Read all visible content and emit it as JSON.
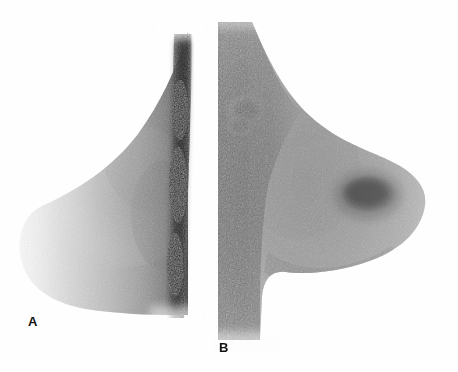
{
  "figure": {
    "kind": "scintimammography-image-pair",
    "background_color": "#fefefe",
    "width": 458,
    "height": 372,
    "panels": [
      {
        "label": "A",
        "label_x": 28,
        "label_y": 315,
        "description": "lateral breast scintigram with diffuse homogeneous uptake and no focal lesion",
        "view": "lateral",
        "chest_wall_side": "right",
        "focal_lesion": "none",
        "peak_intensity_color": "#111111",
        "parenchyma_color": "#9a9a9a"
      },
      {
        "label": "B",
        "label_x": 219,
        "label_y": 341,
        "description": "lateral breast scintigram showing intense focal uptake in the breast and increased axillary activity",
        "view": "lateral",
        "chest_wall_side": "left",
        "focal_lesion": "present",
        "focal_lesion_center_x": 368,
        "focal_lesion_center_y": 194,
        "focal_lesion_radius_x": 26,
        "focal_lesion_radius_y": 17,
        "axillary_focus_center_x": 246,
        "axillary_focus_center_y": 110,
        "peak_intensity_color": "#0a0a0a",
        "parenchyma_color": "#8e8e8e"
      }
    ]
  }
}
